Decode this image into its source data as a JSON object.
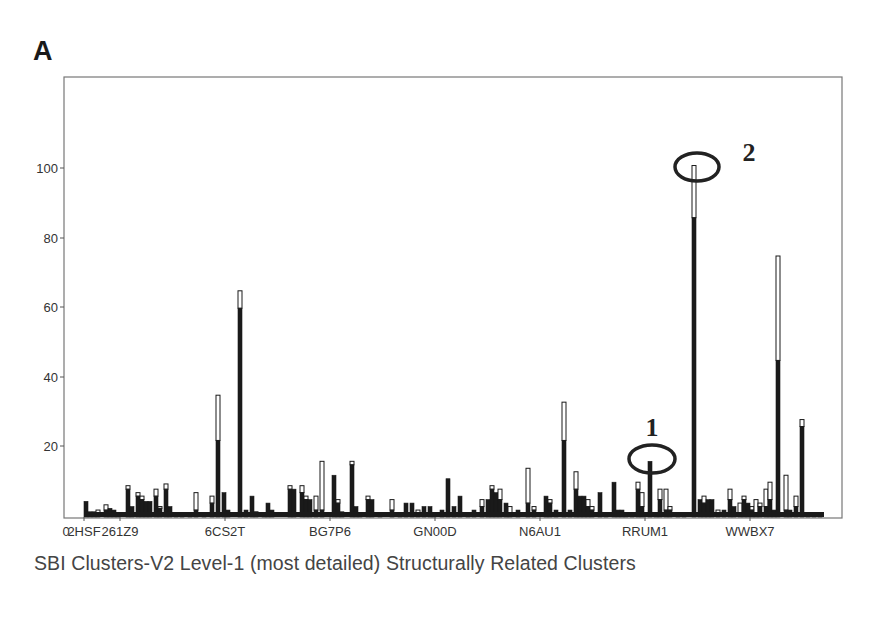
{
  "panel_label": "A",
  "chart_data": {
    "type": "bar",
    "subtype": "stacked",
    "title": "",
    "xlabel": "SBI Clusters-V2 Level-1 (most detailed) Structurally Related Clusters",
    "ylabel": "",
    "ylim": [
      0,
      115
    ],
    "yticks": [
      20,
      40,
      60,
      80,
      100
    ],
    "x_origin_label": "0",
    "xtick_labels": [
      "2HSF",
      "261Z9",
      "6CS2T",
      "BG7P6",
      "GN00D",
      "N6AU1",
      "RRUM1",
      "WWBX7"
    ],
    "grid": false,
    "legend": null,
    "series": [
      {
        "name": "dark (filled) portion",
        "color": "#1a1a1a"
      },
      {
        "name": "total (outlined white) portion",
        "color": "#ffffff"
      }
    ],
    "annotations": [
      {
        "label": "1",
        "target_cluster_x_px": 650,
        "value": 16,
        "shape": "ellipse"
      },
      {
        "label": "2",
        "target_cluster_x_px": 694,
        "value": 101,
        "shape": "ellipse"
      }
    ],
    "bars": [
      {
        "x": 86,
        "dark": 4.5,
        "total": 4.5
      },
      {
        "x": 90,
        "dark": 1.5,
        "total": 1.5
      },
      {
        "x": 94,
        "dark": 1.5,
        "total": 1.5
      },
      {
        "x": 98,
        "dark": 1,
        "total": 2
      },
      {
        "x": 106,
        "dark": 2,
        "total": 3.5
      },
      {
        "x": 110,
        "dark": 2.5,
        "total": 2.5
      },
      {
        "x": 114,
        "dark": 2,
        "total": 2
      },
      {
        "x": 118,
        "dark": 0.5,
        "total": 1
      },
      {
        "x": 128,
        "dark": 8,
        "total": 9
      },
      {
        "x": 132,
        "dark": 3,
        "total": 3
      },
      {
        "x": 138,
        "dark": 6,
        "total": 7
      },
      {
        "x": 142,
        "dark": 5,
        "total": 6
      },
      {
        "x": 146,
        "dark": 4.5,
        "total": 4.5
      },
      {
        "x": 150,
        "dark": 4.5,
        "total": 4.5
      },
      {
        "x": 156,
        "dark": 6,
        "total": 8
      },
      {
        "x": 160,
        "dark": 2.5,
        "total": 3
      },
      {
        "x": 166,
        "dark": 8,
        "total": 9.5
      },
      {
        "x": 170,
        "dark": 3,
        "total": 3
      },
      {
        "x": 176,
        "dark": 1,
        "total": 1
      },
      {
        "x": 182,
        "dark": 1,
        "total": 1
      },
      {
        "x": 190,
        "dark": 1,
        "total": 1
      },
      {
        "x": 196,
        "dark": 2,
        "total": 7
      },
      {
        "x": 204,
        "dark": 0.5,
        "total": 0.5
      },
      {
        "x": 212,
        "dark": 4,
        "total": 6
      },
      {
        "x": 218,
        "dark": 22,
        "total": 35
      },
      {
        "x": 224,
        "dark": 7,
        "total": 7
      },
      {
        "x": 228,
        "dark": 2,
        "total": 2
      },
      {
        "x": 240,
        "dark": 60,
        "total": 65
      },
      {
        "x": 246,
        "dark": 2,
        "total": 2
      },
      {
        "x": 252,
        "dark": 6,
        "total": 6
      },
      {
        "x": 256,
        "dark": 1,
        "total": 1.5
      },
      {
        "x": 264,
        "dark": 1,
        "total": 1
      },
      {
        "x": 268,
        "dark": 4,
        "total": 4
      },
      {
        "x": 272,
        "dark": 2,
        "total": 2
      },
      {
        "x": 290,
        "dark": 8,
        "total": 9
      },
      {
        "x": 294,
        "dark": 8,
        "total": 8
      },
      {
        "x": 302,
        "dark": 7,
        "total": 9
      },
      {
        "x": 306,
        "dark": 5,
        "total": 6
      },
      {
        "x": 310,
        "dark": 5,
        "total": 5
      },
      {
        "x": 316,
        "dark": 2,
        "total": 6
      },
      {
        "x": 322,
        "dark": 2,
        "total": 16
      },
      {
        "x": 334,
        "dark": 12,
        "total": 12
      },
      {
        "x": 338,
        "dark": 4,
        "total": 5
      },
      {
        "x": 342,
        "dark": 1.5,
        "total": 1.5
      },
      {
        "x": 352,
        "dark": 15,
        "total": 16
      },
      {
        "x": 356,
        "dark": 3,
        "total": 3
      },
      {
        "x": 360,
        "dark": 1,
        "total": 1
      },
      {
        "x": 368,
        "dark": 5,
        "total": 6
      },
      {
        "x": 372,
        "dark": 5,
        "total": 5
      },
      {
        "x": 380,
        "dark": 1,
        "total": 1
      },
      {
        "x": 392,
        "dark": 2,
        "total": 5
      },
      {
        "x": 400,
        "dark": 0.5,
        "total": 1
      },
      {
        "x": 406,
        "dark": 4,
        "total": 4
      },
      {
        "x": 412,
        "dark": 4,
        "total": 4
      },
      {
        "x": 418,
        "dark": 1,
        "total": 2
      },
      {
        "x": 424,
        "dark": 3,
        "total": 3
      },
      {
        "x": 430,
        "dark": 3,
        "total": 3
      },
      {
        "x": 434,
        "dark": 1,
        "total": 1
      },
      {
        "x": 442,
        "dark": 2,
        "total": 2
      },
      {
        "x": 448,
        "dark": 11,
        "total": 11
      },
      {
        "x": 454,
        "dark": 3,
        "total": 3
      },
      {
        "x": 460,
        "dark": 6,
        "total": 6
      },
      {
        "x": 468,
        "dark": 1,
        "total": 1
      },
      {
        "x": 474,
        "dark": 2,
        "total": 2
      },
      {
        "x": 482,
        "dark": 3,
        "total": 5
      },
      {
        "x": 488,
        "dark": 5,
        "total": 5
      },
      {
        "x": 492,
        "dark": 8,
        "total": 9
      },
      {
        "x": 496,
        "dark": 7,
        "total": 7
      },
      {
        "x": 500,
        "dark": 5,
        "total": 8
      },
      {
        "x": 506,
        "dark": 4,
        "total": 4
      },
      {
        "x": 510,
        "dark": 1,
        "total": 3
      },
      {
        "x": 518,
        "dark": 2,
        "total": 2
      },
      {
        "x": 528,
        "dark": 4,
        "total": 14
      },
      {
        "x": 534,
        "dark": 2,
        "total": 3
      },
      {
        "x": 546,
        "dark": 6,
        "total": 6
      },
      {
        "x": 550,
        "dark": 4,
        "total": 5
      },
      {
        "x": 556,
        "dark": 2,
        "total": 2
      },
      {
        "x": 564,
        "dark": 22,
        "total": 33
      },
      {
        "x": 570,
        "dark": 2,
        "total": 2
      },
      {
        "x": 576,
        "dark": 8,
        "total": 13
      },
      {
        "x": 580,
        "dark": 6,
        "total": 6
      },
      {
        "x": 584,
        "dark": 6,
        "total": 6
      },
      {
        "x": 588,
        "dark": 3,
        "total": 5
      },
      {
        "x": 592,
        "dark": 2,
        "total": 3
      },
      {
        "x": 600,
        "dark": 7,
        "total": 7
      },
      {
        "x": 606,
        "dark": 1,
        "total": 1
      },
      {
        "x": 614,
        "dark": 10,
        "total": 10
      },
      {
        "x": 618,
        "dark": 2,
        "total": 2
      },
      {
        "x": 622,
        "dark": 2,
        "total": 2
      },
      {
        "x": 626,
        "dark": 1,
        "total": 1
      },
      {
        "x": 632,
        "dark": 1,
        "total": 1
      },
      {
        "x": 638,
        "dark": 8,
        "total": 10
      },
      {
        "x": 642,
        "dark": 3,
        "total": 7
      },
      {
        "x": 650,
        "dark": 16,
        "total": 16
      },
      {
        "x": 656,
        "dark": 1,
        "total": 1
      },
      {
        "x": 660,
        "dark": 5,
        "total": 8
      },
      {
        "x": 666,
        "dark": 2,
        "total": 8
      },
      {
        "x": 670,
        "dark": 2,
        "total": 3
      },
      {
        "x": 678,
        "dark": 1,
        "total": 1
      },
      {
        "x": 684,
        "dark": 0.5,
        "total": 0.5
      },
      {
        "x": 694,
        "dark": 86,
        "total": 101
      },
      {
        "x": 700,
        "dark": 5,
        "total": 5
      },
      {
        "x": 704,
        "dark": 4,
        "total": 6
      },
      {
        "x": 708,
        "dark": 5,
        "total": 5
      },
      {
        "x": 712,
        "dark": 5,
        "total": 5
      },
      {
        "x": 718,
        "dark": 1,
        "total": 2
      },
      {
        "x": 724,
        "dark": 2,
        "total": 2
      },
      {
        "x": 730,
        "dark": 5,
        "total": 8
      },
      {
        "x": 734,
        "dark": 3,
        "total": 3
      },
      {
        "x": 740,
        "dark": 1,
        "total": 4
      },
      {
        "x": 744,
        "dark": 5,
        "total": 6
      },
      {
        "x": 748,
        "dark": 4,
        "total": 4
      },
      {
        "x": 752,
        "dark": 2,
        "total": 3
      },
      {
        "x": 756,
        "dark": 1,
        "total": 5
      },
      {
        "x": 760,
        "dark": 3,
        "total": 4
      },
      {
        "x": 766,
        "dark": 3,
        "total": 8
      },
      {
        "x": 770,
        "dark": 5,
        "total": 10
      },
      {
        "x": 774,
        "dark": 2,
        "total": 2
      },
      {
        "x": 778,
        "dark": 45,
        "total": 75
      },
      {
        "x": 786,
        "dark": 2,
        "total": 12
      },
      {
        "x": 790,
        "dark": 2,
        "total": 2
      },
      {
        "x": 796,
        "dark": 3,
        "total": 6
      },
      {
        "x": 802,
        "dark": 26,
        "total": 28
      },
      {
        "x": 808,
        "dark": 0.5,
        "total": 1
      },
      {
        "x": 814,
        "dark": 0.5,
        "total": 1
      },
      {
        "x": 820,
        "dark": 0.5,
        "total": 1
      }
    ]
  },
  "layout": {
    "plot_left": 64,
    "plot_right": 842,
    "plot_top": 77,
    "baseline_y": 517,
    "px_per_unit": 3.48,
    "ytick_y": {
      "20": 446,
      "40": 377,
      "60": 307,
      "80": 238,
      "100": 168
    },
    "xtick_x": [
      84,
      120,
      225,
      330,
      435,
      540,
      645,
      750
    ],
    "origin_label_x": 66,
    "annotation_positions": [
      {
        "label_x": 652,
        "label_y": 436,
        "ell_cx": 652,
        "ell_cy": 459,
        "ell_rx": 23,
        "ell_ry": 14
      },
      {
        "label_x": 749,
        "label_y": 161,
        "ell_cx": 697,
        "ell_cy": 167,
        "ell_rx": 22,
        "ell_ry": 14
      }
    ]
  }
}
